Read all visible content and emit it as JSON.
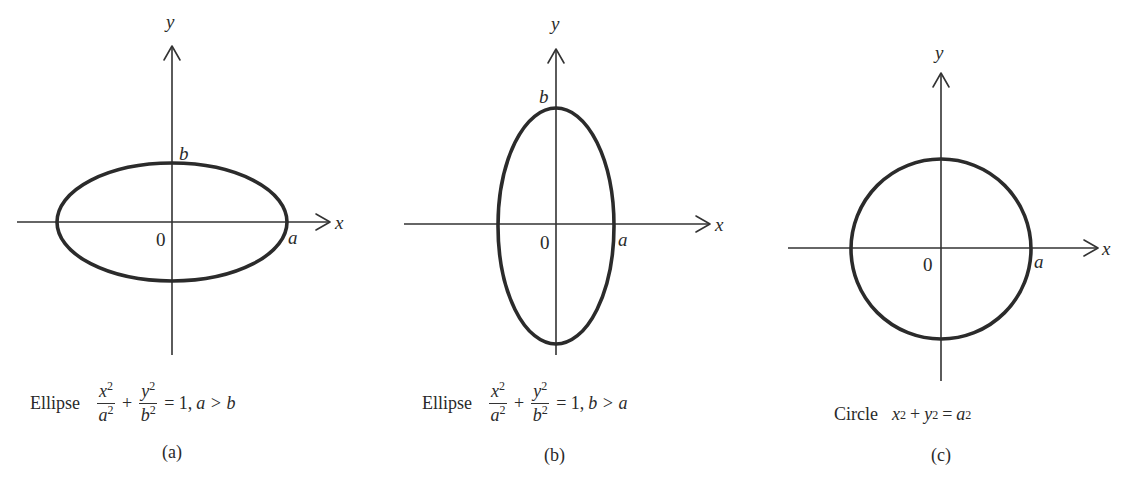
{
  "figures": [
    {
      "id": "a",
      "caption": "(a)",
      "shape_name": "Ellipse",
      "equation": {
        "term1_num": "x",
        "term1_den": "a",
        "exp": "2",
        "term2_num": "y",
        "term2_den": "b",
        "rhs": "= 1,",
        "condition": "a > b"
      },
      "axis_labels": {
        "x": "x",
        "y": "y",
        "origin": "0",
        "a": "a",
        "b": "b"
      }
    },
    {
      "id": "b",
      "caption": "(b)",
      "shape_name": "Ellipse",
      "equation": {
        "term1_num": "x",
        "term1_den": "a",
        "exp": "2",
        "term2_num": "y",
        "term2_den": "b",
        "rhs": "= 1,",
        "condition": "b > a"
      },
      "axis_labels": {
        "x": "x",
        "y": "y",
        "origin": "0",
        "a": "a",
        "b": "b"
      }
    },
    {
      "id": "c",
      "caption": "(c)",
      "shape_name": "Circle",
      "equation": {
        "lhs1": "x",
        "lhs2": "y",
        "rhs": "a",
        "exp": "2",
        "plus": "+",
        "equals": "="
      },
      "axis_labels": {
        "x": "x",
        "y": "y",
        "origin": "0",
        "a": "a"
      }
    }
  ],
  "geometry": {
    "a": {
      "cx": 172,
      "cy": 222,
      "rx": 114,
      "ry": 58
    },
    "b": {
      "cx": 556,
      "cy": 225,
      "rx": 58,
      "ry": 118
    },
    "c": {
      "cx": 941,
      "cy": 248,
      "r": 90
    }
  },
  "colors": {
    "ink": "#2b2b2b",
    "background": "#ffffff"
  }
}
